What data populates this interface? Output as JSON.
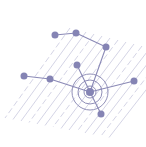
{
  "illustration": {
    "subject": "network-graph-with-target",
    "colors": {
      "background": "#ffffff",
      "node": "#8584b4",
      "edge": "#8a89b6",
      "hatch": "#c9c9de",
      "ring": "#8483b0"
    },
    "nodes": [
      {
        "id": "n1",
        "x": 55,
        "y": 35
      },
      {
        "id": "n2",
        "x": 76,
        "y": 33
      },
      {
        "id": "n3",
        "x": 106,
        "y": 47
      },
      {
        "id": "n4",
        "x": 77,
        "y": 65
      },
      {
        "id": "n5",
        "x": 24,
        "y": 76
      },
      {
        "id": "n6",
        "x": 50,
        "y": 79
      },
      {
        "id": "n7",
        "x": 90,
        "y": 92
      },
      {
        "id": "n8",
        "x": 134,
        "y": 81
      },
      {
        "id": "n9",
        "x": 101,
        "y": 114
      }
    ],
    "edges": [
      [
        "n1",
        "n2"
      ],
      [
        "n2",
        "n3"
      ],
      [
        "n3",
        "n7"
      ],
      [
        "n4",
        "n7"
      ],
      [
        "n5",
        "n6"
      ],
      [
        "n6",
        "n7"
      ],
      [
        "n7",
        "n8"
      ],
      [
        "n7",
        "n9"
      ]
    ],
    "target": {
      "cx": 90,
      "cy": 92,
      "rings": [
        6,
        12,
        18
      ]
    }
  }
}
